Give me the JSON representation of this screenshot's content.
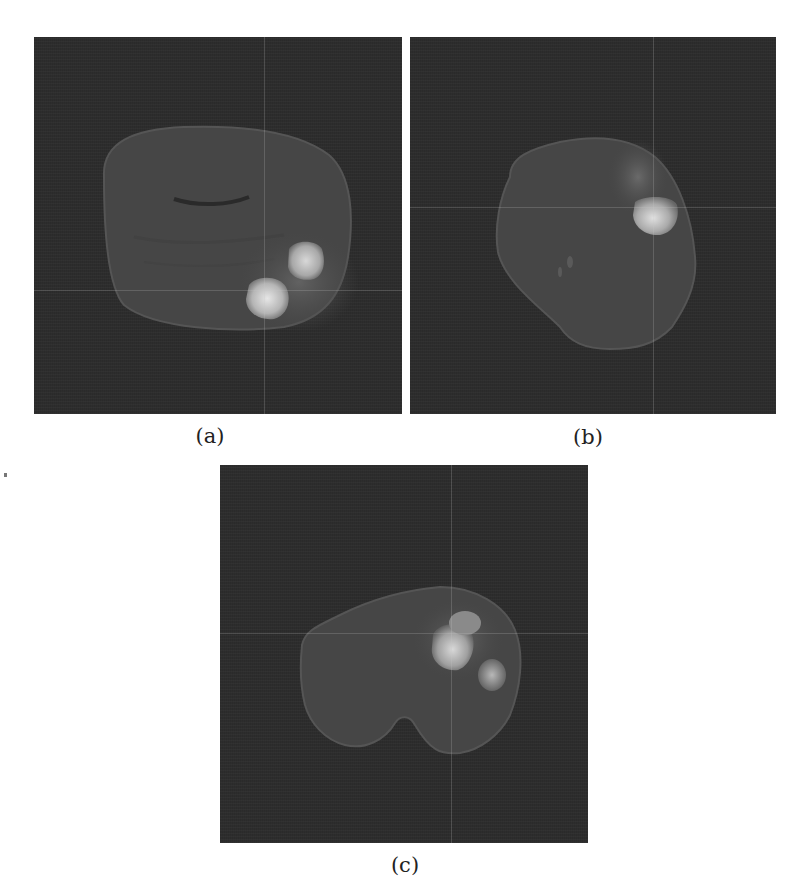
{
  "figure": {
    "panels": [
      {
        "id": "a",
        "caption": "(a)",
        "view": "axial",
        "background": "#2d2d2d"
      },
      {
        "id": "b",
        "caption": "(b)",
        "view": "coronal",
        "background": "#2d2d2d"
      },
      {
        "id": "c",
        "caption": "(c)",
        "view": "sagittal",
        "background": "#2d2d2d"
      }
    ]
  },
  "colors": {
    "panel_bg": "#2d2d2d",
    "brain_tissue": "#4a4a4a",
    "tumor_bright": "#c8c8c8",
    "crosshair": "#8a8a8a",
    "caption_text": "#222222"
  }
}
